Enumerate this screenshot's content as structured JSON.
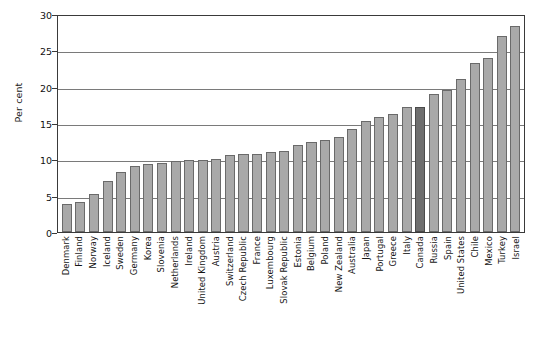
{
  "chart_data": {
    "type": "bar",
    "title": "",
    "subtitle": "",
    "xlabel": "",
    "ylabel": "Per cent",
    "ylim": [
      0,
      30
    ],
    "ytick_values": [
      0,
      5,
      10,
      15,
      20,
      25,
      30
    ],
    "ytick_labels": [
      "0",
      "5",
      "10",
      "15",
      "20",
      "25",
      "30"
    ],
    "grid": true,
    "grid_axis": "y",
    "legend": false,
    "legend_position": "none",
    "highlight_category": "Canada",
    "colors": {
      "bar": "#a9a9a9",
      "bar_edge": "#6a6a6a",
      "highlight_bar": "#6e6e6e",
      "highlight_edge": "#4a4a4a",
      "axis": "#3a3a3a",
      "gridline": "#7a7a7a",
      "text": "#151515",
      "background": "#ffffff"
    },
    "categories": [
      "Denmark",
      "Finland",
      "Norway",
      "Iceland",
      "Sweden",
      "Germany",
      "Korea",
      "Slovenia",
      "Netherlands",
      "Ireland",
      "United Kingdom",
      "Austria",
      "Switzerland",
      "Czech Republic",
      "France",
      "Luxembourg",
      "Slovak Republic",
      "Estonia",
      "Belgium",
      "Poland",
      "New Zealand",
      "Australia",
      "Japan",
      "Portugal",
      "Greece",
      "Italy",
      "Canada",
      "Russia",
      "Spain",
      "United States",
      "Chile",
      "Mexico",
      "Turkey",
      "Israel"
    ],
    "values": [
      3.8,
      4.1,
      5.2,
      7.0,
      8.2,
      9.1,
      9.4,
      9.5,
      9.8,
      9.9,
      9.9,
      10.0,
      10.6,
      10.7,
      10.8,
      11.0,
      11.2,
      12.0,
      12.4,
      12.7,
      13.1,
      14.2,
      15.3,
      15.8,
      16.2,
      17.2,
      17.2,
      19.0,
      19.6,
      21.0,
      23.2,
      24.0,
      27.0,
      28.3
    ]
  }
}
